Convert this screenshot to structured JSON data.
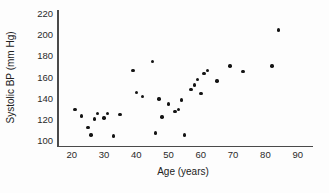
{
  "figure": {
    "background_color": "#fdfdfd",
    "dot_color": "#141414",
    "axis_color": "#4a4a4a",
    "text_color": "#222222"
  },
  "chart_data": {
    "type": "scatter",
    "title": "",
    "xlabel": "Age (years)",
    "ylabel": "Systolic BP (mm Hg)",
    "xlim": [
      20,
      90
    ],
    "ylim": [
      100,
      220
    ],
    "xticks": [
      20,
      30,
      40,
      50,
      60,
      70,
      80,
      90
    ],
    "yticks": [
      100,
      120,
      140,
      160,
      180,
      200,
      220
    ],
    "grid": false,
    "legend": false,
    "series_name": "Systolic BP vs Age",
    "points": [
      [
        21,
        130
      ],
      [
        23,
        124
      ],
      [
        25,
        113
      ],
      [
        26,
        106
      ],
      [
        27,
        121
      ],
      [
        28,
        126
      ],
      [
        30,
        122
      ],
      [
        31,
        126
      ],
      [
        33,
        105
      ],
      [
        35,
        125
      ],
      [
        39,
        167
      ],
      [
        40,
        146
      ],
      [
        42,
        142
      ],
      [
        45,
        175
      ],
      [
        46,
        108
      ],
      [
        47,
        140
      ],
      [
        48,
        123
      ],
      [
        50,
        135
      ],
      [
        52,
        128
      ],
      [
        53,
        130
      ],
      [
        54,
        139
      ],
      [
        55,
        106
      ],
      [
        57,
        149
      ],
      [
        58,
        153
      ],
      [
        59,
        158
      ],
      [
        60,
        145
      ],
      [
        61,
        164
      ],
      [
        62,
        167
      ],
      [
        65,
        157
      ],
      [
        69,
        171
      ],
      [
        73,
        166
      ],
      [
        82,
        171
      ],
      [
        84,
        205
      ]
    ]
  }
}
